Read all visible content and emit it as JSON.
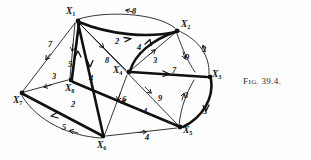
{
  "figure": {
    "caption_prefix": "F",
    "caption_smallcaps": "IG.",
    "caption_number": "39.4.",
    "caption_full": "Fig. 39.4."
  },
  "graph": {
    "type": "directed-weighted-network",
    "ink_color": "#111111",
    "background": "#fefefe",
    "nodes": [
      {
        "id": "X1",
        "label": "X",
        "sub": "1",
        "x": 77,
        "y": 20,
        "label_x": 66,
        "label_y": 7
      },
      {
        "id": "X2",
        "label": "X",
        "sub": "2",
        "x": 177,
        "y": 31,
        "label_x": 181,
        "label_y": 20
      },
      {
        "id": "X3",
        "label": "X",
        "sub": "3",
        "x": 210,
        "y": 77,
        "label_x": 212,
        "label_y": 70
      },
      {
        "id": "X4",
        "label": "X",
        "sub": "4",
        "x": 128,
        "y": 72,
        "label_x": 113,
        "label_y": 66
      },
      {
        "id": "X5",
        "label": "X",
        "sub": "5",
        "x": 180,
        "y": 128,
        "label_x": 183,
        "label_y": 126
      },
      {
        "id": "X6",
        "label": "X",
        "sub": "6",
        "x": 103,
        "y": 137,
        "label_x": 97,
        "label_y": 141
      },
      {
        "id": "X7",
        "label": "X",
        "sub": "7",
        "x": 21,
        "y": 93,
        "label_x": 13,
        "label_y": 96
      },
      {
        "id": "X8",
        "label": "X",
        "sub": "8",
        "x": 71,
        "y": 81,
        "label_x": 65,
        "label_y": 84
      }
    ],
    "edges": [
      {
        "id": "e1",
        "from": "X2",
        "to": "X1",
        "weight": "8",
        "style": "thin",
        "wx": 132,
        "wy": 8,
        "curve": "up"
      },
      {
        "id": "e2",
        "from": "X1",
        "to": "X2",
        "weight": "2",
        "style": "thick",
        "wx": 115,
        "wy": 38,
        "curve": "down"
      },
      {
        "id": "e3",
        "from": "X1",
        "to": "X7",
        "weight": "7",
        "style": "thin",
        "wx": 48,
        "wy": 41
      },
      {
        "id": "e4",
        "from": "X1",
        "to": "X8",
        "weight": "5",
        "style": "thin",
        "wx": 68,
        "wy": 61
      },
      {
        "id": "e5",
        "from": "X8",
        "to": "X1",
        "weight": "4",
        "style": "thick",
        "wx": 89,
        "wy": 75
      },
      {
        "id": "e6",
        "from": "X1",
        "to": "X4",
        "weight": "8",
        "style": "thin",
        "wx": 105,
        "wy": 57
      },
      {
        "id": "e7",
        "from": "X1",
        "to": "X5",
        "weight": "9",
        "style": "thin",
        "wx": 158,
        "wy": 95
      },
      {
        "id": "e8",
        "from": "X4",
        "to": "X2",
        "weight": "4",
        "style": "thick",
        "wx": 137,
        "wy": 44
      },
      {
        "id": "e9",
        "from": "X4",
        "to": "X2",
        "weight": "3",
        "style": "thin",
        "wx": 153,
        "wy": 57
      },
      {
        "id": "e10",
        "from": "X2",
        "to": "X3",
        "weight": "9",
        "style": "thin",
        "wx": 185,
        "wy": 54
      },
      {
        "id": "e11",
        "from": "X3",
        "to": "X2",
        "weight": "3",
        "style": "thin",
        "wx": 202,
        "wy": 46,
        "curve": "right"
      },
      {
        "id": "e12",
        "from": "X4",
        "to": "X3",
        "weight": "7",
        "style": "thick",
        "wx": 172,
        "wy": 67
      },
      {
        "id": "e13",
        "from": "X5",
        "to": "X3",
        "weight": "3",
        "style": "thin",
        "wx": 184,
        "wy": 92
      },
      {
        "id": "e14",
        "from": "X3",
        "to": "X5",
        "weight": "3",
        "style": "thick",
        "wx": 203,
        "wy": 108,
        "curve": "right"
      },
      {
        "id": "e15",
        "from": "X4",
        "to": "X6",
        "weight": "6",
        "style": "thin",
        "wx": 122,
        "wy": 96
      },
      {
        "id": "e16",
        "from": "X5",
        "to": "X8",
        "weight": "4",
        "style": "thick",
        "wx": 143,
        "wy": 108
      },
      {
        "id": "e17",
        "from": "X6",
        "to": "X5",
        "weight": "4",
        "style": "thin",
        "wx": 145,
        "wy": 134
      },
      {
        "id": "e18",
        "from": "X8",
        "to": "X7",
        "weight": "3",
        "style": "thin",
        "wx": 52,
        "wy": 73
      },
      {
        "id": "e19",
        "from": "X6",
        "to": "X7",
        "weight": "2",
        "style": "thick",
        "wx": 71,
        "wy": 101
      },
      {
        "id": "e20",
        "from": "X7",
        "to": "X6",
        "weight": "5",
        "style": "thin",
        "wx": 62,
        "wy": 124,
        "curve": "down"
      },
      {
        "id": "e21",
        "from": "X1",
        "to": "X6",
        "weight": "",
        "style": "thick"
      }
    ],
    "weights_listing": [
      "8",
      "2",
      "7",
      "5",
      "4",
      "8",
      "9",
      "4",
      "3",
      "9",
      "3",
      "7",
      "3",
      "3",
      "6",
      "4",
      "4",
      "3",
      "2",
      "5"
    ]
  }
}
